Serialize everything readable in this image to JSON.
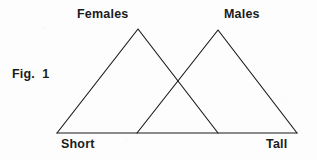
{
  "figure": {
    "caption": "Fig.  1",
    "background_color": "#fdfdfd",
    "ink_color": "#1b1b1b"
  },
  "labels": {
    "females": "Females",
    "males": "Males",
    "axis_left": "Short",
    "axis_right": "Tall"
  },
  "chart_data": {
    "type": "line",
    "title": "Fig.  1",
    "xlabel": "",
    "ylabel": "",
    "grid": false,
    "legend_position": "above-peaks",
    "axis_tick_labels": [
      "Short",
      "Tall"
    ],
    "xlim": [
      57,
      297
    ],
    "ylim": [
      133,
      29
    ],
    "annotations": [
      "Females",
      "Males",
      "Short",
      "Tall",
      "Fig.  1"
    ],
    "baseline": {
      "x1": 57,
      "y1": 133,
      "x2": 297,
      "y2": 133
    },
    "series": [
      {
        "name": "Females",
        "label_x": 77,
        "label_y": 14,
        "peak_x": 138,
        "peak_y": 29,
        "points": [
          {
            "x": 57,
            "y": 133
          },
          {
            "x": 138,
            "y": 29
          },
          {
            "x": 218,
            "y": 133
          }
        ]
      },
      {
        "name": "Males",
        "label_x": 224,
        "label_y": 14,
        "peak_x": 218,
        "peak_y": 30,
        "points": [
          {
            "x": 137,
            "y": 133
          },
          {
            "x": 218,
            "y": 30
          },
          {
            "x": 297,
            "y": 133
          }
        ]
      }
    ],
    "intersection": {
      "x": 178,
      "y": 80
    }
  }
}
